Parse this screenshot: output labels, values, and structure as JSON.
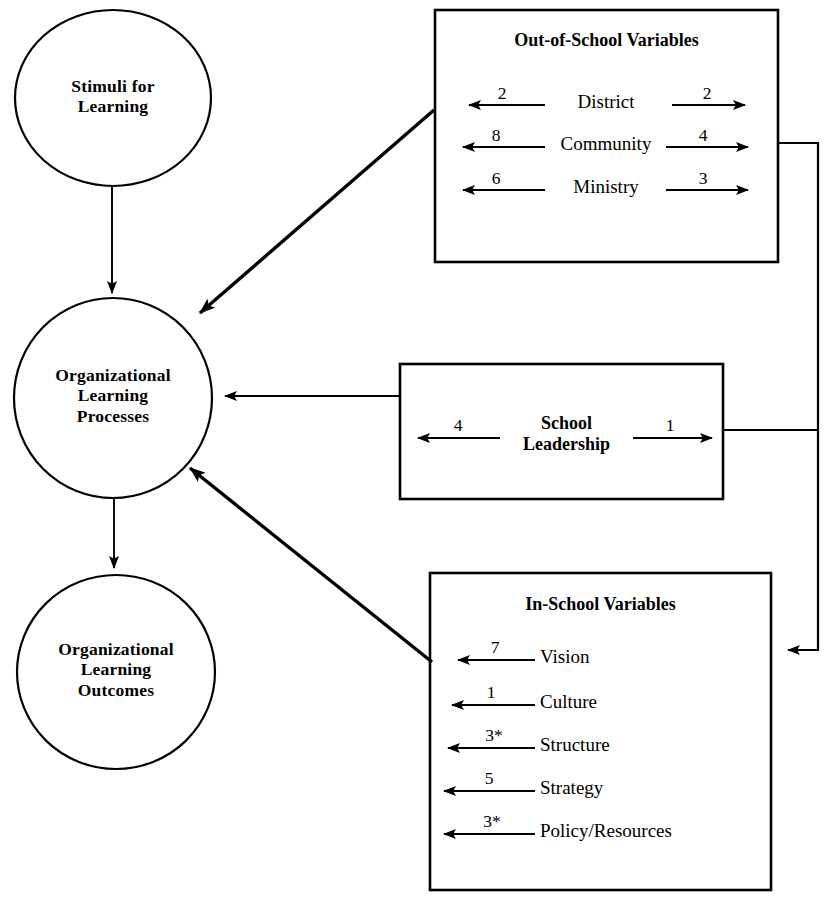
{
  "diagram": {
    "circles": [
      {
        "id": "stimuli",
        "label": "Stimuli for\nLearning"
      },
      {
        "id": "processes",
        "label": "Organizational\nLearning\nProcesses"
      },
      {
        "id": "outcomes",
        "label": "Organizational\nLearning\nOutcomes"
      }
    ],
    "boxes": [
      {
        "id": "out-of-school",
        "title": "Out-of-School Variables",
        "rows": [
          {
            "label": "District",
            "left_value": "2",
            "right_value": "2"
          },
          {
            "label": "Community",
            "left_value": "8",
            "right_value": "4"
          },
          {
            "label": "Ministry",
            "left_value": "6",
            "right_value": "3"
          }
        ]
      },
      {
        "id": "school-leadership",
        "title": "School\nLeadership",
        "rows": [
          {
            "label": "",
            "left_value": "4",
            "right_value": "1"
          }
        ]
      },
      {
        "id": "in-school",
        "title": "In-School Variables",
        "rows": [
          {
            "label": "Vision",
            "left_value": "7",
            "right_value": ""
          },
          {
            "label": "Culture",
            "left_value": "1",
            "right_value": ""
          },
          {
            "label": "Structure",
            "left_value": "3*",
            "right_value": ""
          },
          {
            "label": "Strategy",
            "left_value": "5",
            "right_value": ""
          },
          {
            "label": "Policy/Resources",
            "left_value": "3*",
            "right_value": ""
          }
        ]
      }
    ],
    "colors": {
      "stroke": "#000000",
      "fill": "#ffffff",
      "text": "#000000"
    }
  }
}
